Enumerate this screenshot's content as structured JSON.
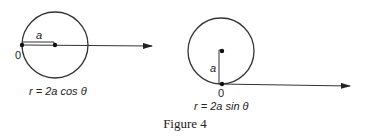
{
  "figure": {
    "caption": "Figure 4",
    "left": {
      "equation": "r = 2a cos θ",
      "radius_label": "a",
      "origin_label": "0"
    },
    "right": {
      "equation": "r = 2a sin θ",
      "radius_label": "a",
      "origin_label": "0"
    }
  }
}
